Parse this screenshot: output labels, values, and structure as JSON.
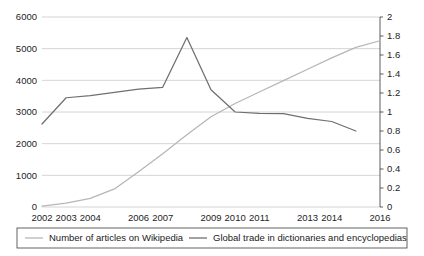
{
  "chart_data": {
    "type": "line",
    "title": "",
    "xlabel": "",
    "ylabel": "",
    "grid": true,
    "legend_position": "bottom",
    "x": [
      2002,
      2003,
      2004,
      2005,
      2006,
      2007,
      2008,
      2009,
      2010,
      2011,
      2012,
      2013,
      2014,
      2015,
      2016
    ],
    "xtick_labels": [
      "2002",
      "2003",
      "2004",
      "2006",
      "2007",
      "2009",
      "2010",
      "2011",
      "2013",
      "2014",
      "2016"
    ],
    "left_axis": {
      "ylim": [
        0,
        6000
      ],
      "ticks": [
        0,
        1000,
        2000,
        3000,
        4000,
        5000,
        6000
      ],
      "tick_labels": [
        "0",
        "1000",
        "2000",
        "3000",
        "4000",
        "5000",
        "6000"
      ]
    },
    "right_axis": {
      "ylim": [
        0,
        2
      ],
      "ticks": [
        0,
        0.2,
        0.4,
        0.6,
        0.8,
        1,
        1.2,
        1.4,
        1.6,
        1.8,
        2
      ],
      "tick_labels": [
        "0",
        "0.2",
        "0.4",
        "0.6",
        "0.8",
        "1",
        "1.2",
        "1.4",
        "1.6",
        "1.8",
        "2"
      ]
    },
    "series": [
      {
        "name": "Number of articles on Wikipedia",
        "axis": "right",
        "color": "#b6b6b6",
        "values": [
          0.01,
          0.04,
          0.09,
          0.19,
          0.37,
          0.56,
          0.76,
          0.95,
          1.09,
          1.21,
          1.33,
          1.45,
          1.57,
          1.68,
          1.75
        ]
      },
      {
        "name": "Global trade in dictionaries and encyclopedias",
        "axis": "left",
        "color": "#6f6f6f",
        "values": [
          2620,
          3450,
          3520,
          3620,
          3720,
          3780,
          5350,
          3700,
          3000,
          2960,
          2950,
          2800,
          2700,
          2400,
          null
        ]
      }
    ]
  },
  "legend": {
    "items": [
      {
        "label": "Number of articles on Wikipedia",
        "color": "#b6b6b6"
      },
      {
        "label": "Global trade in dictionaries and encyclopedias",
        "color": "#6f6f6f"
      }
    ]
  }
}
